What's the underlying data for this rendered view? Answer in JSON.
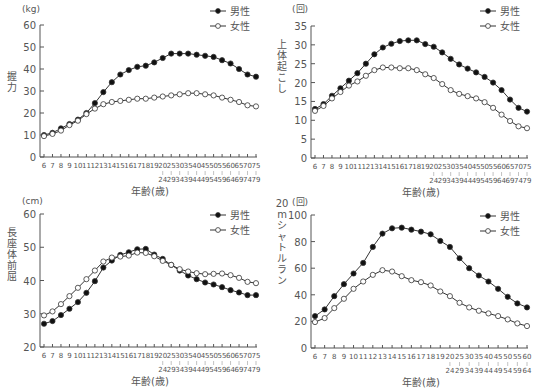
{
  "chart_data": [
    {
      "type": "line",
      "id": "grip",
      "unit": "(kg)",
      "ylabel": "握力",
      "xlabel": "年齢(歳)",
      "ylim": [
        0,
        60
      ],
      "yticks": [
        0,
        10,
        20,
        30,
        40,
        50,
        60
      ],
      "categories": [
        "6",
        "7",
        "8",
        "9",
        "10",
        "11",
        "12",
        "13",
        "14",
        "15",
        "16",
        "17",
        "18",
        "19",
        "20-24",
        "25-29",
        "30-34",
        "35-39",
        "40-44",
        "45-49",
        "50-54",
        "55-59",
        "60-64",
        "65-69",
        "70-74",
        "75-79"
      ],
      "series": [
        {
          "name": "男性",
          "marker": "filled",
          "values": [
            10,
            11,
            13,
            15,
            17,
            20,
            24.5,
            29.5,
            34,
            37.5,
            39.5,
            41,
            41.5,
            43,
            45,
            47,
            47,
            47,
            46.5,
            46,
            45.5,
            44,
            42.5,
            40,
            37.5,
            36.5
          ]
        },
        {
          "name": "女性",
          "marker": "open",
          "values": [
            9.5,
            10.5,
            12,
            14.5,
            16.5,
            19.5,
            22,
            24,
            25,
            25.5,
            26,
            26.5,
            26.5,
            27,
            27.5,
            28,
            28.5,
            29,
            29,
            28.5,
            28,
            27,
            26,
            25,
            23.5,
            23
          ]
        }
      ]
    },
    {
      "type": "line",
      "id": "situp",
      "unit": "(回)",
      "ylabel": "上体起こし",
      "xlabel": "年齢(歳)",
      "ylim": [
        0,
        35
      ],
      "yticks": [
        0,
        5,
        10,
        15,
        20,
        25,
        30,
        35
      ],
      "categories": [
        "6",
        "7",
        "8",
        "9",
        "10",
        "11",
        "12",
        "13",
        "14",
        "15",
        "16",
        "17",
        "18",
        "19",
        "20-24",
        "25-29",
        "30-34",
        "35-39",
        "40-44",
        "45-49",
        "50-54",
        "55-59",
        "60-64",
        "65-69",
        "70-74",
        "75-79"
      ],
      "series": [
        {
          "name": "男性",
          "marker": "filled",
          "values": [
            13,
            14.3,
            16.5,
            18.5,
            20.5,
            22.5,
            25,
            27.5,
            29.3,
            30.3,
            31,
            31.2,
            31.2,
            30.2,
            29.5,
            28,
            26.3,
            24.8,
            23.7,
            22.7,
            21.5,
            20,
            18,
            15.5,
            13.3,
            12.3
          ]
        },
        {
          "name": "女性",
          "marker": "open",
          "values": [
            12.5,
            13.8,
            15.8,
            17.5,
            19.2,
            20.3,
            21.8,
            23.3,
            24,
            24,
            23.8,
            23.8,
            23.3,
            22.2,
            21.2,
            19.6,
            18,
            17,
            16.4,
            15.8,
            14.8,
            13.3,
            11.5,
            9.8,
            8.4,
            7.9
          ]
        }
      ]
    },
    {
      "type": "line",
      "id": "sit-and-reach",
      "unit": "(cm)",
      "ylabel": "長座体前屈",
      "xlabel": "年齢(歳)",
      "ylim": [
        20,
        60
      ],
      "yticks": [
        20,
        30,
        40,
        50,
        60
      ],
      "categories": [
        "6",
        "7",
        "8",
        "9",
        "10",
        "11",
        "12",
        "13",
        "14",
        "15",
        "16",
        "17",
        "18",
        "19",
        "20-24",
        "25-29",
        "30-34",
        "35-39",
        "40-44",
        "45-49",
        "50-54",
        "55-59",
        "60-64",
        "65-69",
        "70-74",
        "75-79"
      ],
      "series": [
        {
          "name": "男性",
          "marker": "filled",
          "values": [
            27,
            27.8,
            29.6,
            31.5,
            33.5,
            36.3,
            39.8,
            43.9,
            46,
            47.7,
            48.5,
            49.4,
            49.5,
            47.8,
            46.5,
            44.7,
            43,
            41.5,
            40.4,
            39.4,
            38.8,
            38,
            37.1,
            36.4,
            35.6,
            35.6
          ]
        },
        {
          "name": "女性",
          "marker": "open",
          "values": [
            29.5,
            30.7,
            32.9,
            35.3,
            37.8,
            40.4,
            43,
            45.7,
            46.9,
            47.2,
            47.5,
            48.4,
            48.3,
            47.3,
            45.9,
            44.7,
            43.4,
            42.7,
            42.2,
            41.9,
            42,
            42.1,
            41.6,
            40.8,
            39.6,
            39.2
          ]
        }
      ]
    },
    {
      "type": "line",
      "id": "shuttle-run",
      "unit": "(回)",
      "ylabel": "20mシャトルラン",
      "xlabel": "年齢(歳)",
      "ylim": [
        0,
        100
      ],
      "yticks": [
        0,
        20,
        40,
        60,
        80,
        100
      ],
      "categories": [
        "6",
        "7",
        "8",
        "9",
        "10",
        "11",
        "12",
        "13",
        "14",
        "15",
        "16",
        "17",
        "18",
        "19",
        "20-24",
        "25-29",
        "30-34",
        "35-39",
        "40-44",
        "45-49",
        "50-54",
        "55-59",
        "60-64"
      ],
      "series": [
        {
          "name": "男性",
          "marker": "filled",
          "values": [
            24,
            29,
            39,
            48,
            56,
            64,
            76,
            86,
            90,
            90.5,
            89,
            87.5,
            85.5,
            80.5,
            76,
            67.5,
            60,
            54.5,
            50,
            44.5,
            38.5,
            33.5,
            30.5
          ]
        },
        {
          "name": "女性",
          "marker": "open",
          "values": [
            19.5,
            22.5,
            30,
            37,
            44.5,
            50,
            55,
            58.5,
            57.5,
            54,
            51,
            49.5,
            47,
            42.5,
            39,
            34,
            30.5,
            28,
            26,
            24,
            21.5,
            18.5,
            16.5
          ]
        }
      ]
    }
  ],
  "legend": {
    "male": "男性",
    "female": "女性"
  },
  "colors": {
    "line": "#333333",
    "axis": "#555555",
    "text": "#555555",
    "marker_fill_male": "#111111",
    "marker_fill_female": "#ffffff"
  }
}
